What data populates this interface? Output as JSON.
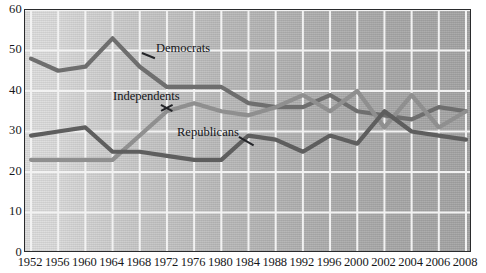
{
  "chart_data": {
    "type": "line",
    "title": "",
    "subtitle": "",
    "xlabel": "",
    "ylabel": "",
    "ylim": [
      0,
      60
    ],
    "ytick_values": [
      0,
      10,
      20,
      30,
      40,
      50,
      60
    ],
    "ytick_labels": [
      "0",
      "10",
      "20",
      "30",
      "40",
      "50",
      "60"
    ],
    "grid": true,
    "legend_position": "inline-annotations",
    "categories": [
      "1952",
      "1956",
      "1960",
      "1964",
      "1968",
      "1972",
      "1976",
      "1980",
      "1984",
      "1988",
      "1992",
      "1996",
      "2000",
      "2002",
      "2004",
      "2006",
      "2008"
    ],
    "series": [
      {
        "name": "Democrats",
        "color": "#6e6e6e",
        "values": [
          48,
          45,
          46,
          53,
          46,
          41,
          41,
          41,
          37,
          36,
          36,
          39,
          35,
          34,
          33,
          36,
          35
        ]
      },
      {
        "name": "Independents",
        "color": "#8f8f8f",
        "values": [
          23,
          23,
          23,
          23,
          29,
          35,
          37,
          35,
          34,
          36,
          39,
          35,
          40,
          31,
          39,
          31,
          35
        ]
      },
      {
        "name": "Republicans",
        "color": "#5e5e5e",
        "values": [
          29,
          30,
          31,
          25,
          25,
          24,
          23,
          23,
          29,
          28,
          25,
          29,
          27,
          35,
          30,
          29,
          28
        ]
      }
    ],
    "annotations": [
      {
        "text": "Democrats",
        "series": "Democrats"
      },
      {
        "text": "Independents",
        "series": "Independents"
      },
      {
        "text": "Republicans",
        "series": "Republicans"
      }
    ]
  },
  "colors": {
    "democrats": "#6e6e6e",
    "independents": "#8f8f8f",
    "republicans": "#5e5e5e",
    "gridline": "#f2f2f2",
    "frame": "#2a2b2d",
    "text": "#17181a"
  }
}
